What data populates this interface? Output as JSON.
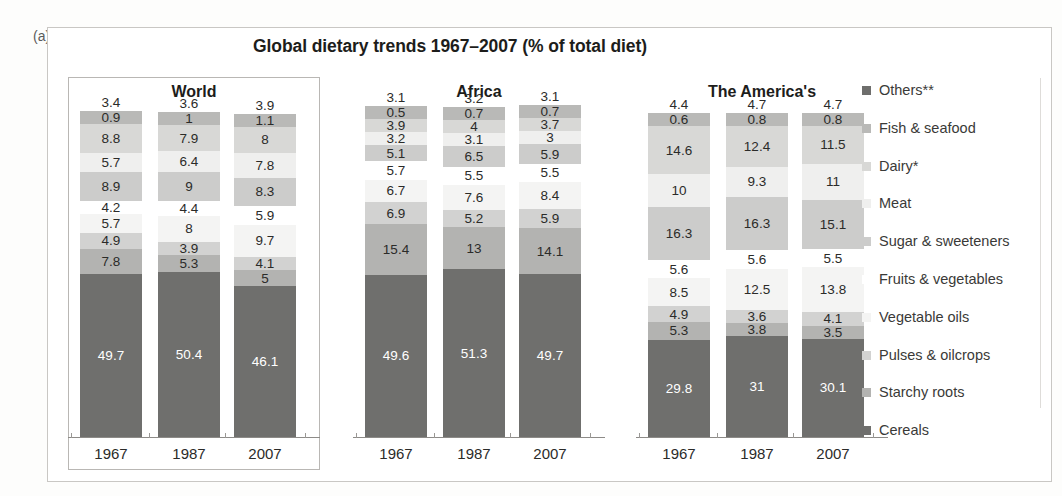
{
  "panel_label": "(a)",
  "title": "Global dietary trends 1967–2007 (% of total diet)",
  "groups": [
    {
      "name": "World",
      "years": [
        "1967",
        "1987",
        "2007"
      ]
    },
    {
      "name": "Africa",
      "years": [
        "1967",
        "1987",
        "2007"
      ]
    },
    {
      "name": "The America's",
      "years": [
        "1967",
        "1987",
        "2007"
      ]
    }
  ],
  "legend": [
    {
      "label": "Others**",
      "color": "#6e6e6c"
    },
    {
      "label": "Fish & seafood",
      "color": "#b9b9b7"
    },
    {
      "label": "Dairy*",
      "color": "#d8d8d6"
    },
    {
      "label": "Meat",
      "color": "#efefee"
    },
    {
      "label": "Sugar & sweeteners",
      "color": "#cccccb"
    },
    {
      "label": "Fruits & vegetables",
      "color": "#ffffff"
    },
    {
      "label": "Vegetable oils",
      "color": "#f4f4f3"
    },
    {
      "label": "Pulses & oilcrops",
      "color": "#d2d2d1"
    },
    {
      "label": "Starchy roots",
      "color": "#b3b3b1"
    },
    {
      "label": "Cereals",
      "color": "#6f6f6d"
    }
  ],
  "chart_data": {
    "type": "bar",
    "title": "Global dietary trends 1967–2007 (% of total diet)",
    "xlabel": "",
    "ylabel": "% of total diet",
    "ylim": [
      0,
      100
    ],
    "stacked": true,
    "grid": false,
    "legend_position": "right",
    "categories": [
      "World 1967",
      "World 1987",
      "World 2007",
      "Africa 1967",
      "Africa 1987",
      "Africa 2007",
      "The America's 1967",
      "The America's 1987",
      "The America's 2007"
    ],
    "series": [
      {
        "name": "Others**",
        "values": [
          3.4,
          3.6,
          3.9,
          3.1,
          3.2,
          3.1,
          4.4,
          4.7,
          4.7
        ]
      },
      {
        "name": "Fish & seafood",
        "values": [
          0.9,
          1,
          1.1,
          0.5,
          0.7,
          0.7,
          0.6,
          0.8,
          0.8
        ]
      },
      {
        "name": "Dairy*",
        "values": [
          8.8,
          7.9,
          8,
          3.9,
          4,
          3.7,
          14.6,
          12.4,
          11.5
        ]
      },
      {
        "name": "Meat",
        "values": [
          5.7,
          6.4,
          7.8,
          3.2,
          3.1,
          3,
          10,
          9.3,
          11
        ]
      },
      {
        "name": "Sugar & sweeteners",
        "values": [
          8.9,
          9,
          8.3,
          5.1,
          6.5,
          5.9,
          16.3,
          16.3,
          15.1
        ]
      },
      {
        "name": "Fruits & vegetables",
        "values": [
          4.2,
          4.4,
          5.9,
          5.7,
          5.5,
          5.5,
          5.6,
          5.6,
          5.5
        ]
      },
      {
        "name": "Vegetable oils",
        "values": [
          5.7,
          8,
          9.7,
          6.7,
          7.6,
          8.4,
          8.5,
          12.5,
          13.8
        ]
      },
      {
        "name": "Pulses & oilcrops",
        "values": [
          4.9,
          3.9,
          4.1,
          6.9,
          5.2,
          5.9,
          4.9,
          3.6,
          4.1
        ]
      },
      {
        "name": "Starchy roots",
        "values": [
          7.8,
          5.3,
          5,
          15.4,
          13,
          14.1,
          5.3,
          3.8,
          3.5
        ]
      },
      {
        "name": "Cereals",
        "values": [
          49.7,
          50.4,
          46.1,
          49.6,
          51.3,
          49.7,
          29.8,
          31,
          30.1
        ]
      }
    ]
  }
}
